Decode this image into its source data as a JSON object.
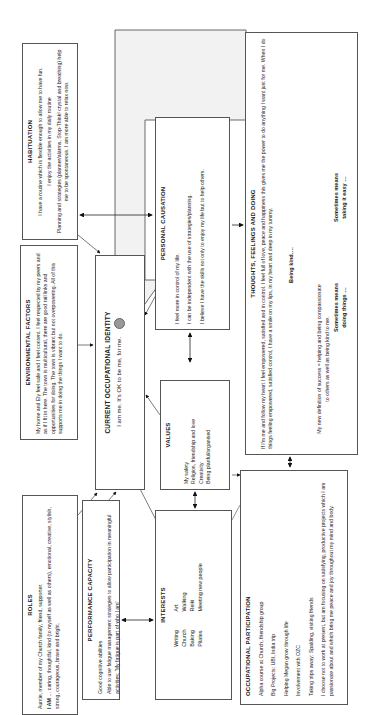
{
  "diagram": {
    "habituation": {
      "title": "HABITUATION",
      "lines": [
        "I have a routine which is flexible enough to allow me to have fun.",
        "I enjoy the activities in my daily routine",
        "Planning and strategies (planner/alarms, Stop-Think! crystal and breathing) help me to be spontaneous. I am more able to relax now."
      ]
    },
    "environmental_factors": {
      "title": "ENVIRONMENTAL FACTORS",
      "text": "My home and Ely feel safe and I feel content. I feel respected by my peers and as if I fit in here. The town is multicultural, there are good rail links and opportunities for doing. The town is vibrant but not overpowering. All of this supports me in doing the things I want to do."
    },
    "roles": {
      "title": "ROLES",
      "line1": "Auntie, member of my Church family, friend, supporter.",
      "i_am_label": "I AM",
      "line2": "… caring, thoughtful, kind (to myself as well as others), emotional, creative, stylish, strong, courageous, brave and bright."
    },
    "performance_capacity": {
      "title": "PERFORMANCE CAPACITY",
      "lines": [
        "Good cognitive abilities",
        "Able to use fatigue management strategies to allow participation in meaningful activities: 'My fatigue is part of who I am'"
      ]
    },
    "current_identity": {
      "title": "CURRENT OCCUPATIONAL IDENTITY",
      "text": "I am me. It's OK to be me, for me.",
      "icon": "smiley-face-icon"
    },
    "personal_causation": {
      "title": "PERSONAL CAUSATION",
      "lines": [
        "I feel more in control of my life.",
        "I can be independent with the use of strategies/planning.",
        "I believe I have the skills not only to enjoy my life but to help others."
      ]
    },
    "values": {
      "title": "VALUES",
      "items": [
        "My safety",
        "Religion, friendship and love",
        "Creativity",
        "Being planful/organised"
      ]
    },
    "interests": {
      "title": "INTERESTS",
      "col1": [
        "Writing",
        "Church",
        "Baking",
        "Pilates"
      ],
      "col2": [
        "Art",
        "Walking",
        "Reiki",
        "Meeting new people"
      ]
    },
    "thoughts_feelings_doing": {
      "title": "THOUGHTS, FEELINGS AND DOING",
      "text1": "If I'm me and follow my heart I feel empowered, satisfied and in control. I feel full of love, peace and happiness this gives me the power to do anything I want just for me. When I do things feeling empowered, satisfied control, I have a smile on my lips, in my heart and deep in my tummy.",
      "being_kind": "Being kind….",
      "sometimes_doing": "Sometimes means doing things …",
      "sometimes_easy": "Sometimes means taking it easy …",
      "text2": "My new definition of success = helping and being compassionate to others as well as being kind to me."
    },
    "occupational_participation": {
      "title": "OCCUPATIONAL PARTICIPATION",
      "items": [
        "Alpha course at Church, friendship group",
        "Big Projects: UBI, India trip",
        "Helping Megan grow through life",
        "Involvement with OZC",
        "Taking trips away: Spalding, visiting friends",
        "I choose not to work at present, but am focusing on satisfying, productive projects which I am passionate about and which bring me peace and joy throughout my mind and body."
      ]
    },
    "colors": {
      "border": "#555555",
      "big_arrow_fill": "#f2f2f2",
      "line": "#333333"
    }
  }
}
